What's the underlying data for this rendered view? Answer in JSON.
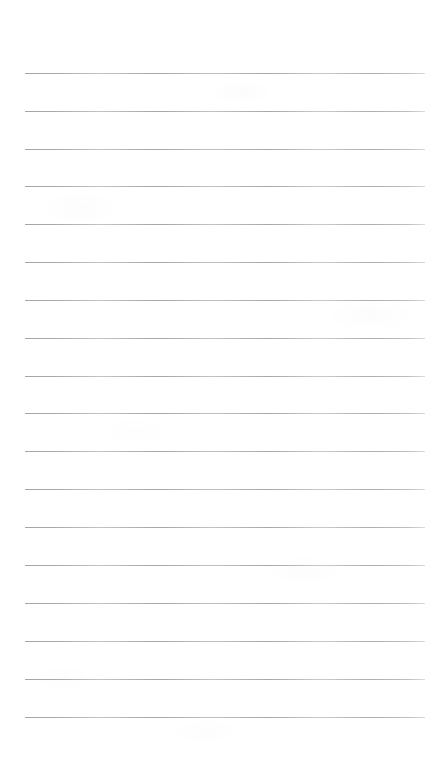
{
  "page": {
    "kind": "blank-lined-paper-scan",
    "width": 447,
    "height": 770,
    "background_color": "#ffffff",
    "text_content": "",
    "ruling": {
      "line_count": 18,
      "line_color": "#a9a9a9",
      "line_thickness_px": 1,
      "first_line_y": 73,
      "line_spacing_px": 37.9,
      "line_start_x": 25,
      "line_end_x": 425,
      "line_width_px": 400,
      "left_margin_px": 25,
      "right_margin_px": 22,
      "vertical_margin_rule": "none",
      "line_y_positions": [
        73,
        111,
        149,
        186,
        224,
        262,
        300,
        338,
        376,
        413,
        451,
        489,
        527,
        565,
        603,
        641,
        679,
        717
      ]
    }
  }
}
